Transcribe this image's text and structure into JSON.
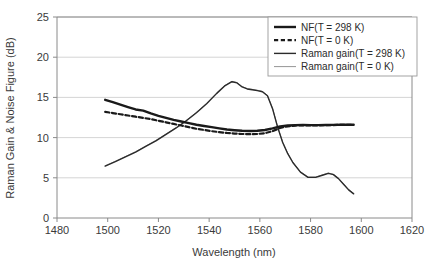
{
  "chart_data": {
    "type": "line",
    "title": "",
    "xlabel": "Wavelength (nm)",
    "ylabel": "Raman Gain & Noise Figure (dB)",
    "xlim": [
      1480,
      1620
    ],
    "ylim": [
      0,
      25
    ],
    "xticks": [
      1480,
      1500,
      1520,
      1540,
      1560,
      1580,
      1600,
      1620
    ],
    "yticks": [
      0,
      5,
      10,
      15,
      20,
      25
    ],
    "xtick_labels": [
      "1480",
      "1500",
      "1520",
      "1540",
      "1560",
      "1580",
      "1600",
      "1620"
    ],
    "ytick_labels": [
      "0",
      "5",
      "10",
      "15",
      "20",
      "25"
    ],
    "grid": "horizontal",
    "legend_position": "top-right",
    "series": [
      {
        "name": "NF(T = 298 K)",
        "style": "solid",
        "width": 2.4,
        "color": "#1a1a1a",
        "x": [
          1499,
          1502,
          1505,
          1508,
          1511,
          1514,
          1517,
          1520,
          1523,
          1526,
          1529,
          1532,
          1535,
          1538,
          1541,
          1544,
          1547,
          1550,
          1553,
          1556,
          1559,
          1562,
          1565,
          1568,
          1571,
          1574,
          1577,
          1580,
          1583,
          1586,
          1589,
          1592,
          1595,
          1597
        ],
        "y": [
          14.7,
          14.4,
          14.1,
          13.8,
          13.5,
          13.35,
          13.0,
          12.7,
          12.45,
          12.2,
          12.0,
          11.8,
          11.6,
          11.45,
          11.3,
          11.15,
          11.0,
          10.92,
          10.85,
          10.82,
          10.85,
          10.95,
          11.15,
          11.4,
          11.5,
          11.55,
          11.57,
          11.55,
          11.55,
          11.57,
          11.58,
          11.6,
          11.6,
          11.6
        ]
      },
      {
        "name": "NF(T = 0 K)",
        "style": "dashed",
        "width": 2.2,
        "color": "#1a1a1a",
        "x": [
          1499,
          1502,
          1505,
          1508,
          1511,
          1514,
          1517,
          1520,
          1523,
          1526,
          1529,
          1532,
          1535,
          1538,
          1541,
          1544,
          1547,
          1550,
          1553,
          1556,
          1559,
          1562,
          1565,
          1568,
          1571,
          1574,
          1577,
          1580,
          1583,
          1586,
          1589,
          1592,
          1595,
          1597
        ],
        "y": [
          13.2,
          13.05,
          12.9,
          12.75,
          12.6,
          12.45,
          12.3,
          12.1,
          11.9,
          11.7,
          11.5,
          11.3,
          11.1,
          10.95,
          10.8,
          10.68,
          10.58,
          10.5,
          10.45,
          10.42,
          10.45,
          10.55,
          10.8,
          11.2,
          11.4,
          11.5,
          11.53,
          11.52,
          11.52,
          11.54,
          11.56,
          11.58,
          11.6,
          11.6
        ]
      },
      {
        "name": "Raman gain(T = 298 K)",
        "style": "solid",
        "width": 1.4,
        "color": "#2b2b2b",
        "x": [
          1499,
          1503,
          1507,
          1511,
          1515,
          1519,
          1523,
          1527,
          1531,
          1535,
          1539,
          1543,
          1546,
          1549,
          1551,
          1553,
          1555,
          1557,
          1559,
          1561,
          1563,
          1565,
          1567,
          1569,
          1571,
          1573,
          1576,
          1579,
          1582,
          1585,
          1587,
          1589,
          1591,
          1593,
          1595,
          1597
        ],
        "y": [
          6.45,
          7.0,
          7.6,
          8.2,
          8.9,
          9.6,
          10.4,
          11.2,
          12.1,
          13.1,
          14.2,
          15.5,
          16.4,
          16.95,
          16.8,
          16.3,
          16.05,
          15.95,
          15.85,
          15.7,
          15.2,
          13.6,
          11.3,
          9.4,
          8.0,
          6.9,
          5.7,
          5.05,
          5.05,
          5.35,
          5.55,
          5.4,
          4.9,
          4.2,
          3.5,
          3.0
        ]
      },
      {
        "name": "Raman gain(T = 0 K)",
        "style": "solid",
        "width": 0.8,
        "color": "#7a7a7a",
        "x": [
          1499,
          1503,
          1507,
          1511,
          1515,
          1519,
          1523,
          1527,
          1531,
          1535,
          1539,
          1543,
          1546,
          1549,
          1551,
          1553,
          1555,
          1557,
          1559,
          1561,
          1563,
          1565,
          1567,
          1569,
          1571,
          1573,
          1576,
          1579,
          1582,
          1585,
          1587,
          1589,
          1591,
          1593,
          1595,
          1597
        ],
        "y": [
          6.5,
          7.05,
          7.65,
          8.25,
          8.95,
          9.65,
          10.45,
          11.25,
          12.15,
          13.15,
          14.25,
          15.55,
          16.45,
          17.0,
          16.85,
          16.35,
          16.1,
          16.0,
          15.9,
          15.75,
          15.25,
          13.65,
          11.35,
          9.45,
          8.05,
          6.95,
          5.75,
          5.1,
          5.1,
          5.4,
          5.6,
          5.45,
          4.95,
          4.25,
          3.55,
          3.05
        ]
      }
    ]
  },
  "legend": {
    "items": [
      {
        "label": "NF(T = 298 K)"
      },
      {
        "label": "NF(T = 0 K)"
      },
      {
        "label": "Raman gain(T = 298 K)"
      },
      {
        "label": "Raman gain(T = 0 K)"
      }
    ]
  }
}
